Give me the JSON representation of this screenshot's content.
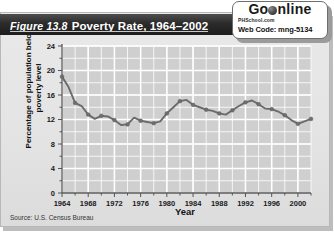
{
  "figure": {
    "number": "Figure 13.8",
    "title": "Poverty Rate, 1964–2002"
  },
  "badge": {
    "brand_go": "Go",
    "brand_online": "nline",
    "globe_icon": "globe-icon",
    "site": "PHSchool.com",
    "web_code_label": "Web Code: mng-5134"
  },
  "source": "Source: U.S. Census Bureau",
  "colors": {
    "line": "#6b6b6b",
    "marker": "#6f6f6f",
    "plot_background": "#cfcfcf",
    "gridline": "#ffffff",
    "axis": "#555555",
    "titlebar": "#222222",
    "panel": "#e4e4e4"
  },
  "chart_data": {
    "type": "line",
    "title": "Poverty Rate, 1964–2002",
    "xlabel": "Year",
    "ylabel": "Percentage of population below poverty level",
    "xlim": [
      1964,
      2002
    ],
    "ylim": [
      0,
      24
    ],
    "ytick_step": 4,
    "yminor_step": 2,
    "xtick_step": 4,
    "xminor_step": 2,
    "grid": true,
    "legend": "none",
    "xticks": [
      1964,
      1968,
      1972,
      1976,
      1980,
      1984,
      1988,
      1992,
      1996,
      2000
    ],
    "yticks": [
      0,
      4,
      8,
      12,
      16,
      20,
      24
    ],
    "x": [
      1964,
      1965,
      1966,
      1967,
      1968,
      1969,
      1970,
      1971,
      1972,
      1973,
      1974,
      1975,
      1976,
      1977,
      1978,
      1979,
      1980,
      1981,
      1982,
      1983,
      1984,
      1985,
      1986,
      1987,
      1988,
      1989,
      1990,
      1991,
      1992,
      1993,
      1994,
      1995,
      1996,
      1997,
      1998,
      1999,
      2000,
      2001,
      2002
    ],
    "values": [
      19.0,
      17.3,
      14.7,
      14.2,
      12.8,
      12.1,
      12.6,
      12.5,
      11.9,
      11.1,
      11.2,
      12.3,
      11.8,
      11.6,
      11.4,
      11.7,
      13.0,
      14.0,
      15.0,
      15.2,
      14.4,
      14.0,
      13.6,
      13.4,
      13.0,
      12.8,
      13.5,
      14.2,
      14.8,
      15.1,
      14.5,
      13.8,
      13.7,
      13.3,
      12.7,
      11.9,
      11.3,
      11.7,
      12.1
    ]
  }
}
